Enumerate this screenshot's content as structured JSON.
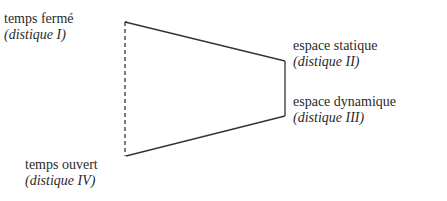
{
  "diagram": {
    "type": "quadrilateral",
    "vertices": {
      "top_left": {
        "label": "temps fermé",
        "sub": "(distique I)"
      },
      "right_top": {
        "label": "espace statique",
        "sub": "(distique II)"
      },
      "right_bottom": {
        "label": "espace dynamique",
        "sub": "(distique III)"
      },
      "bottom_left": {
        "label": "temps ouvert",
        "sub": "(distique IV)"
      }
    },
    "edges": [
      {
        "from": "top_left",
        "to": "right_top",
        "style": "solid"
      },
      {
        "from": "right_top",
        "to": "right_bottom",
        "style": "solid"
      },
      {
        "from": "right_bottom",
        "to": "bottom_left",
        "style": "solid"
      },
      {
        "from": "bottom_left",
        "to": "top_left",
        "style": "dashed"
      }
    ],
    "line_color": "#333333"
  }
}
